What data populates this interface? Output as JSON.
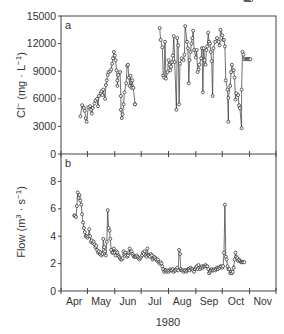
{
  "figure": {
    "xlabel": "1980",
    "month_labels": [
      "Apr",
      "May",
      "Jun",
      "Jul",
      "Aug",
      "Sep",
      "Oct",
      "Nov"
    ]
  },
  "chart_data": [
    {
      "type": "line",
      "panel": "a",
      "title": "",
      "xlabel": "1980",
      "ylabel": "Cl⁻ (mg · L⁻¹)",
      "ylabel_parts": {
        "main": "Cl",
        "sup": "−",
        "unit_open": "(mg · L",
        "unit_sup": "−1",
        "unit_close": ")"
      },
      "x_unit": "days since Apr 1",
      "xlim": [
        0,
        244
      ],
      "ylim": [
        0,
        15000
      ],
      "yticks": [
        0,
        3000,
        6000,
        9000,
        12000,
        15000
      ],
      "xtick_days": [
        0,
        30,
        61,
        91,
        122,
        153,
        183,
        214,
        244
      ],
      "x_categories": [
        "Apr",
        "May",
        "Jun",
        "Jul",
        "Aug",
        "Sep",
        "Oct",
        "Nov"
      ],
      "grid": false,
      "marker": "open-circle",
      "segments": [
        {
          "x": [
            22,
            24,
            26,
            27,
            28,
            29,
            31,
            33,
            34,
            35,
            36,
            38,
            39,
            41,
            42,
            43,
            45,
            46,
            47,
            48,
            50,
            51,
            52,
            53,
            54,
            56,
            57,
            58,
            59,
            60,
            61,
            62,
            63,
            64,
            64,
            65,
            67,
            68,
            68,
            69,
            70,
            71,
            72,
            74,
            75,
            76,
            77,
            78,
            79,
            80,
            81,
            82,
            84,
            84
          ],
          "y": [
            4100,
            5300,
            5000,
            4700,
            3900,
            3500,
            5100,
            5200,
            4800,
            4400,
            5000,
            5500,
            5800,
            6000,
            5200,
            6300,
            6600,
            6800,
            6400,
            7000,
            6000,
            7500,
            8000,
            8600,
            8900,
            9000,
            9200,
            9800,
            10400,
            11100,
            10700,
            10200,
            9100,
            8000,
            7400,
            8600,
            8900,
            6300,
            4800,
            3900,
            4300,
            5400,
            6700,
            7700,
            9600,
            9700,
            8300,
            7400,
            8500,
            7200,
            8000,
            7200,
            5400,
            5400
          ]
        },
        {
          "x": [
            112,
            113,
            115,
            116,
            117,
            118,
            119,
            121,
            122,
            123,
            124,
            125,
            126,
            127,
            128,
            129,
            131,
            132,
            133,
            134,
            135,
            137,
            139,
            140,
            141,
            143,
            144,
            145,
            146,
            147,
            148,
            149,
            150,
            151,
            153,
            154,
            155,
            156,
            157,
            159,
            160,
            161,
            162,
            163,
            164,
            165,
            166,
            167,
            168,
            169,
            170,
            171,
            172,
            173,
            175,
            177,
            179,
            180,
            181,
            183,
            184,
            185,
            186,
            187,
            189,
            190,
            190,
            192,
            193,
            194,
            196,
            197,
            198,
            199,
            201,
            202,
            203,
            205,
            205,
            206,
            207,
            208,
            210,
            211,
            212,
            213,
            214,
            215
          ],
          "y": [
            13700,
            12400,
            11600,
            8500,
            8300,
            12200,
            8200,
            8900,
            10200,
            9700,
            9100,
            9500,
            10000,
            10700,
            12800,
            10000,
            4800,
            12600,
            11800,
            5400,
            9800,
            10400,
            10200,
            10800,
            13900,
            12200,
            11500,
            7700,
            10200,
            11100,
            12000,
            12600,
            13400,
            11300,
            10500,
            11300,
            8900,
            9200,
            9700,
            10400,
            11500,
            6700,
            11500,
            10200,
            9700,
            11300,
            11700,
            13200,
            12200,
            12000,
            11100,
            10100,
            6300,
            11500,
            12200,
            12600,
            12200,
            11800,
            13500,
            12900,
            12400,
            12400,
            11700,
            8000,
            7000,
            3500,
            6100,
            7400,
            8900,
            9700,
            9100,
            8300,
            5900,
            6600,
            6400,
            5300,
            5000,
            2800,
            7000,
            11100,
            10800,
            10300,
            10300,
            10300,
            10300,
            10300,
            10300,
            10300
          ]
        }
      ]
    },
    {
      "type": "line",
      "panel": "b",
      "title": "",
      "xlabel": "1980",
      "ylabel": "Flow (m³ · s⁻¹)",
      "ylabel_parts": {
        "main": "Flow (m",
        "sup": "3",
        "mid": " · s",
        "sup2": "−1",
        "close": ")"
      },
      "x_unit": "days since Apr 1",
      "xlim": [
        0,
        244
      ],
      "ylim": [
        0,
        10
      ],
      "yticks": [
        0,
        2,
        4,
        6,
        8
      ],
      "ytick_labels": [
        "0",
        "2",
        "4",
        "6",
        "8"
      ],
      "top_label": "0",
      "xtick_days": [
        0,
        30,
        61,
        91,
        122,
        153,
        183,
        214,
        244
      ],
      "x_categories": [
        "Apr",
        "May",
        "Jun",
        "Jul",
        "Aug",
        "Sep",
        "Oct",
        "Nov"
      ],
      "grid": false,
      "marker": "open-circle",
      "x": [
        15,
        16,
        17,
        18,
        19,
        20,
        21,
        22,
        23,
        24,
        25,
        26,
        27,
        28,
        29,
        30,
        31,
        32,
        33,
        34,
        35,
        36,
        37,
        38,
        39,
        40,
        41,
        42,
        43,
        44,
        45,
        46,
        47,
        48,
        49,
        50,
        51,
        52,
        53,
        54,
        55,
        56,
        57,
        58,
        59,
        60,
        61,
        62,
        63,
        64,
        65,
        66,
        67,
        68,
        69,
        70,
        71,
        72,
        73,
        74,
        75,
        76,
        77,
        78,
        79,
        80,
        81,
        82,
        83,
        84,
        85,
        86,
        87,
        88,
        89,
        90,
        91,
        92,
        93,
        94,
        95,
        96,
        97,
        98,
        99,
        100,
        101,
        102,
        103,
        104,
        105,
        106,
        107,
        108,
        109,
        110,
        111,
        112,
        113,
        114,
        115,
        116,
        117,
        118,
        119,
        120,
        121,
        122,
        123,
        124,
        125,
        126,
        127,
        128,
        129,
        130,
        131,
        132,
        133,
        134,
        135,
        136,
        137,
        138,
        139,
        140,
        141,
        142,
        143,
        144,
        145,
        146,
        147,
        148,
        149,
        150,
        151,
        152,
        153,
        154,
        155,
        156,
        157,
        158,
        159,
        160,
        161,
        162,
        163,
        164,
        165,
        166,
        167,
        168,
        169,
        170,
        171,
        172,
        173,
        174,
        175,
        176,
        177,
        178,
        179,
        180,
        181,
        182,
        183,
        184,
        185,
        186,
        187,
        188,
        189,
        190,
        191,
        192,
        193,
        194,
        195,
        196,
        197,
        198,
        199,
        200,
        201,
        202,
        203,
        204,
        205,
        206,
        207,
        208,
        209,
        210,
        211,
        212,
        213,
        214,
        215,
        216
      ],
      "y": [
        5.5,
        5.5,
        5.4,
        6.2,
        7.2,
        6.8,
        7.0,
        6.6,
        6.3,
        5.6,
        5.0,
        4.6,
        4.3,
        4.0,
        4.0,
        3.9,
        4.0,
        4.5,
        4.0,
        3.6,
        3.7,
        3.5,
        3.6,
        3.4,
        3.2,
        3.3,
        3.0,
        2.8,
        2.9,
        2.7,
        2.8,
        2.6,
        2.7,
        3.8,
        3.2,
        2.9,
        2.6,
        3.6,
        5.9,
        4.6,
        4.4,
        3.8,
        3.0,
        2.8,
        2.8,
        3.1,
        2.8,
        2.6,
        2.9,
        2.8,
        2.6,
        2.5,
        2.4,
        2.3,
        2.3,
        2.4,
        2.9,
        2.7,
        2.8,
        2.6,
        2.5,
        2.6,
        2.8,
        3.1,
        2.8,
        2.9,
        2.7,
        2.6,
        2.5,
        2.5,
        2.5,
        2.6,
        2.5,
        2.4,
        2.3,
        2.4,
        2.5,
        2.6,
        2.8,
        2.7,
        2.9,
        2.6,
        2.5,
        3.1,
        2.6,
        2.6,
        2.5,
        2.7,
        2.6,
        2.3,
        2.4,
        2.5,
        2.4,
        2.3,
        2.2,
        2.3,
        2.1,
        2.0,
        2.1,
        2.0,
        1.8,
        1.6,
        1.4,
        1.5,
        1.5,
        1.4,
        1.5,
        1.4,
        1.5,
        1.6,
        1.5,
        1.5,
        1.6,
        1.4,
        1.5,
        1.5,
        1.6,
        1.7,
        1.5,
        3.0,
        2.7,
        1.6,
        1.5,
        1.5,
        1.4,
        1.5,
        1.5,
        1.4,
        1.5,
        1.6,
        1.6,
        1.5,
        1.7,
        1.6,
        1.6,
        1.5,
        1.4,
        1.6,
        1.7,
        1.8,
        1.6,
        1.9,
        1.7,
        1.6,
        1.7,
        1.8,
        1.7,
        1.8,
        1.8,
        1.9,
        1.8,
        1.8,
        1.6,
        1.3,
        1.4,
        1.5,
        1.6,
        1.5,
        1.5,
        1.6,
        1.5,
        1.6,
        1.7,
        1.6,
        1.7,
        1.7,
        1.8,
        1.8,
        1.7,
        1.8,
        2.8,
        6.3,
        2.5,
        2.3,
        1.8,
        1.6,
        1.6,
        1.3,
        1.4,
        1.3,
        1.4,
        1.7,
        2.3,
        2.8,
        2.5,
        2.4,
        2.2,
        2.3,
        2.2,
        2.1,
        2.1,
        2.1,
        2.1,
        2.1
      ]
    }
  ],
  "panels": {
    "a": {
      "letter": "a",
      "ytick_labels": [
        "0",
        "3000",
        "6000",
        "9000",
        "12000",
        "15000"
      ],
      "ylabel_main": "Cl",
      "ylabel_sup": "−",
      "ylabel_unit": "(mg · L",
      "ylabel_unit_sup": "−1",
      "ylabel_close": ")"
    },
    "b": {
      "letter": "b",
      "ytick_labels": [
        "0",
        "2",
        "4",
        "6",
        "8"
      ],
      "ylabel_main": "Flow (m",
      "ylabel_sup": "3",
      "ylabel_mid": " · s",
      "ylabel_sup2": "−1",
      "ylabel_close": ")"
    }
  }
}
